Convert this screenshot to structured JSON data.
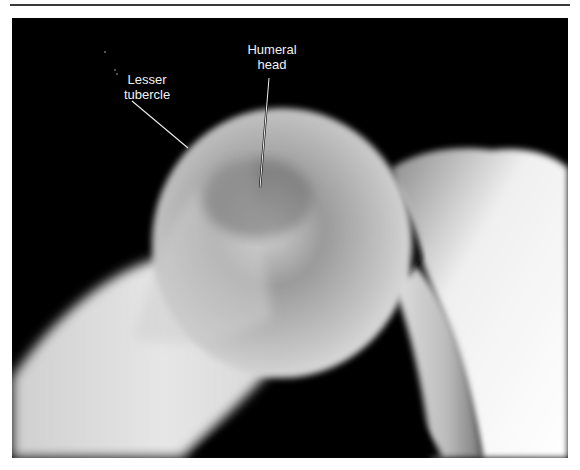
{
  "figure": {
    "type": "radiograph",
    "annotations": [
      {
        "id": "lesser-tubercle",
        "line1": "Lesser",
        "line2": "tubercle"
      },
      {
        "id": "humeral-head",
        "line1": "Humeral",
        "line2": "head"
      }
    ],
    "colors": {
      "background": "#000000",
      "bone_bright": "#e8e8e8",
      "bone_mid": "#b8b8b8",
      "label_text": "#f2f2f2",
      "rule": "#3a3a3a"
    }
  }
}
